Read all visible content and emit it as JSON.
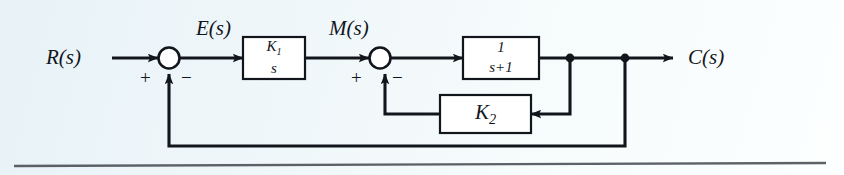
{
  "figure": {
    "kind": "control-system-block-diagram",
    "background_color": "#eef6f9",
    "line_color": "#12161c",
    "block_fill": "#ffffff"
  },
  "signals": {
    "input": "R(s)",
    "error": "E(s)",
    "manipulated": "M(s)",
    "output": "C(s)"
  },
  "summing_junctions": [
    {
      "id": "sum1",
      "name": "first-summing-junction",
      "left_sign": "+",
      "bottom_sign": "−"
    },
    {
      "id": "sum2",
      "name": "second-summing-junction",
      "left_sign": "+",
      "bottom_sign": "−"
    }
  ],
  "blocks": [
    {
      "id": "integrator",
      "name": "gain-integrator-block",
      "type": "fraction",
      "numerator": "K₁",
      "denominator": "s",
      "numerator_base": "K",
      "numerator_sub": "1",
      "transfer_function": "K1/s"
    },
    {
      "id": "lag",
      "name": "first-order-lag-block",
      "type": "fraction",
      "numerator": "1",
      "denominator": "s+1",
      "transfer_function": "1/(s+1)"
    },
    {
      "id": "feedback_gain",
      "name": "feedback-gain-block",
      "type": "gain",
      "label_base": "K",
      "label_sub": "2",
      "transfer_function": "K2"
    }
  ],
  "junction_dots": [
    {
      "id": "dot_inner",
      "name": "inner-loop-takeoff-dot"
    },
    {
      "id": "dot_outer",
      "name": "outer-loop-takeoff-dot"
    }
  ],
  "paths": [
    {
      "id": "input-path",
      "from": "R(s)",
      "to": "sum1"
    },
    {
      "id": "error-path",
      "from": "sum1",
      "to": "integrator"
    },
    {
      "id": "manipulated-path",
      "from": "integrator",
      "to": "sum2"
    },
    {
      "id": "forward-path",
      "from": "sum2",
      "to": "lag"
    },
    {
      "id": "output-path",
      "from": "lag",
      "to": "C(s)"
    },
    {
      "id": "inner-feedback-path",
      "from": "dot_inner",
      "to": "sum2",
      "through": "feedback_gain"
    },
    {
      "id": "outer-feedback-path",
      "from": "dot_outer",
      "to": "sum1"
    }
  ]
}
